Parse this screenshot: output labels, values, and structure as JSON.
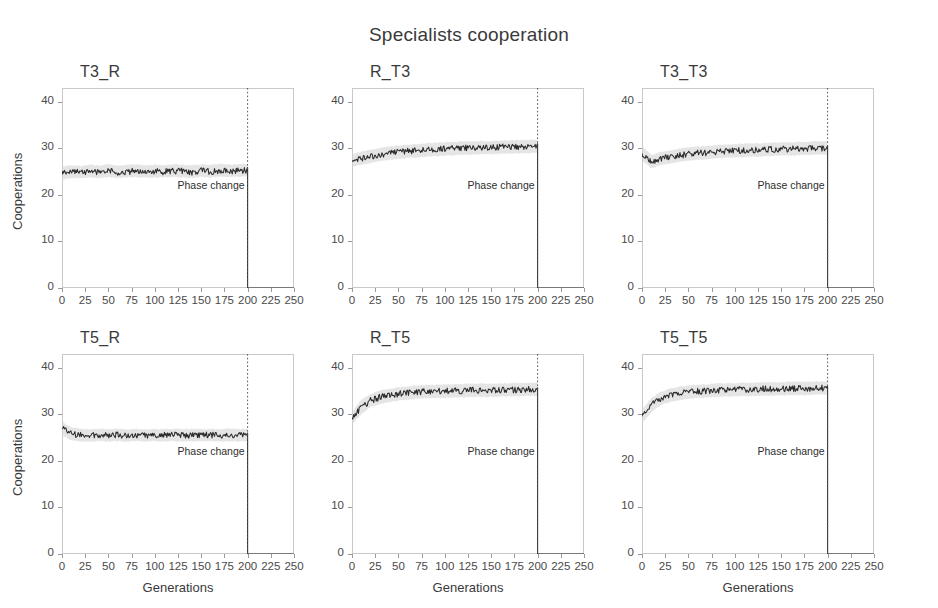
{
  "figure": {
    "title": "Specialists cooperation",
    "xlabel": "Generations",
    "ylabel": "Cooperations",
    "phase_label": "Phase change"
  },
  "chart_data": {
    "type": "line",
    "title": "Specialists cooperation",
    "xlabel": "Generations",
    "ylabel": "Cooperations",
    "xlim": [
      0,
      250
    ],
    "ylim": [
      0,
      43
    ],
    "xticks": [
      0,
      25,
      50,
      75,
      100,
      125,
      150,
      175,
      200,
      225,
      250
    ],
    "yticks": [
      0,
      10,
      20,
      30,
      40
    ],
    "grid": false,
    "legend": "none",
    "annotations": [
      {
        "text": "Phase change",
        "x": 200,
        "type": "vline-dotted",
        "note": "dotted vertical line at generation 200 in every panel"
      }
    ],
    "layout": {
      "rows": 2,
      "cols": 3
    },
    "band_note": "shaded gray band = variability envelope around mean trace",
    "panels": [
      {
        "title": "T3_R",
        "row": 0,
        "col": 0,
        "x": [
          0,
          10,
          20,
          30,
          40,
          50,
          60,
          70,
          80,
          90,
          100,
          110,
          120,
          130,
          140,
          150,
          160,
          170,
          180,
          190,
          200,
          200,
          210,
          220,
          230,
          240,
          250
        ],
        "mean": [
          24.6,
          25.0,
          24.8,
          25.1,
          24.9,
          25.2,
          24.9,
          25.0,
          25.2,
          24.9,
          25.1,
          25.0,
          25.2,
          25.1,
          24.9,
          25.2,
          25.0,
          25.3,
          25.1,
          25.2,
          25.3,
          0,
          0,
          0,
          0,
          0,
          0
        ],
        "band_low": [
          23.4,
          23.8,
          23.7,
          23.9,
          23.8,
          24.0,
          23.8,
          23.9,
          24.0,
          23.8,
          23.9,
          23.9,
          24.0,
          23.9,
          23.8,
          24.0,
          23.9,
          24.1,
          24.0,
          24.0,
          24.1,
          0,
          0,
          0,
          0,
          0,
          0
        ],
        "band_high": [
          25.9,
          26.3,
          26.1,
          26.4,
          26.2,
          26.5,
          26.2,
          26.3,
          26.5,
          26.2,
          26.4,
          26.3,
          26.5,
          26.4,
          26.2,
          26.5,
          26.3,
          26.6,
          26.4,
          26.5,
          26.6,
          0,
          0,
          0,
          0,
          0,
          0
        ]
      },
      {
        "title": "R_T3",
        "row": 0,
        "col": 1,
        "x": [
          0,
          10,
          20,
          30,
          40,
          50,
          60,
          70,
          80,
          90,
          100,
          110,
          120,
          130,
          140,
          150,
          160,
          170,
          180,
          190,
          200,
          200,
          210,
          220,
          230,
          240,
          250
        ],
        "mean": [
          27.4,
          27.9,
          28.3,
          28.7,
          29.0,
          29.2,
          29.4,
          29.5,
          29.7,
          29.8,
          29.9,
          30.0,
          30.1,
          30.1,
          30.2,
          30.2,
          30.3,
          30.3,
          30.4,
          30.4,
          30.5,
          0,
          0,
          0,
          0,
          0,
          0
        ],
        "band_low": [
          26.2,
          26.6,
          27.0,
          27.4,
          27.7,
          27.9,
          28.1,
          28.2,
          28.4,
          28.5,
          28.6,
          28.7,
          28.8,
          28.8,
          28.9,
          28.9,
          29.0,
          29.0,
          29.1,
          29.1,
          29.2,
          0,
          0,
          0,
          0,
          0,
          0
        ],
        "band_high": [
          28.6,
          29.2,
          29.6,
          30.0,
          30.3,
          30.5,
          30.7,
          30.8,
          31.0,
          31.1,
          31.2,
          31.3,
          31.4,
          31.4,
          31.5,
          31.5,
          31.6,
          31.6,
          31.7,
          31.7,
          31.8,
          0,
          0,
          0,
          0,
          0,
          0
        ]
      },
      {
        "title": "T3_T3",
        "row": 0,
        "col": 2,
        "x": [
          0,
          10,
          20,
          30,
          40,
          50,
          60,
          70,
          80,
          90,
          100,
          110,
          120,
          130,
          140,
          150,
          160,
          170,
          180,
          190,
          200,
          200,
          210,
          220,
          230,
          240,
          250
        ],
        "mean": [
          29.0,
          27.2,
          27.8,
          28.2,
          28.5,
          28.8,
          29.0,
          29.1,
          29.3,
          29.4,
          29.5,
          29.6,
          29.7,
          29.7,
          29.8,
          29.9,
          29.9,
          30.0,
          30.0,
          30.1,
          30.1,
          0,
          0,
          0,
          0,
          0,
          0
        ],
        "band_low": [
          27.6,
          25.9,
          26.5,
          26.9,
          27.2,
          27.5,
          27.7,
          27.8,
          28.0,
          28.1,
          28.2,
          28.3,
          28.4,
          28.4,
          28.5,
          28.6,
          28.6,
          28.7,
          28.7,
          28.8,
          28.8,
          0,
          0,
          0,
          0,
          0,
          0
        ],
        "band_high": [
          30.4,
          28.5,
          29.1,
          29.5,
          29.8,
          30.1,
          30.3,
          30.4,
          30.6,
          30.7,
          30.8,
          30.9,
          31.0,
          31.0,
          31.1,
          31.2,
          31.2,
          31.3,
          31.3,
          31.4,
          31.4,
          0,
          0,
          0,
          0,
          0,
          0
        ]
      },
      {
        "title": "T5_R",
        "row": 1,
        "col": 0,
        "x": [
          0,
          10,
          20,
          30,
          40,
          50,
          60,
          70,
          80,
          90,
          100,
          110,
          120,
          130,
          140,
          150,
          160,
          170,
          180,
          190,
          200,
          200,
          210,
          220,
          230,
          240,
          250
        ],
        "mean": [
          27.0,
          25.8,
          25.6,
          25.5,
          25.6,
          25.5,
          25.6,
          25.5,
          25.6,
          25.5,
          25.6,
          25.5,
          25.6,
          25.5,
          25.6,
          25.5,
          25.6,
          25.5,
          25.6,
          25.5,
          25.6,
          0,
          0,
          0,
          0,
          0,
          0
        ],
        "band_low": [
          25.7,
          24.5,
          24.4,
          24.3,
          24.4,
          24.3,
          24.4,
          24.3,
          24.4,
          24.3,
          24.4,
          24.3,
          24.4,
          24.3,
          24.4,
          24.3,
          24.4,
          24.3,
          24.4,
          24.3,
          24.4,
          0,
          0,
          0,
          0,
          0,
          0
        ],
        "band_high": [
          28.3,
          27.1,
          26.8,
          26.7,
          26.8,
          26.7,
          26.8,
          26.7,
          26.8,
          26.7,
          26.8,
          26.7,
          26.8,
          26.7,
          26.8,
          26.7,
          26.8,
          26.7,
          26.8,
          26.7,
          26.8,
          0,
          0,
          0,
          0,
          0,
          0
        ]
      },
      {
        "title": "R_T5",
        "row": 1,
        "col": 1,
        "x": [
          0,
          10,
          20,
          30,
          40,
          50,
          60,
          70,
          80,
          90,
          100,
          110,
          120,
          130,
          140,
          150,
          160,
          170,
          180,
          190,
          200,
          200,
          210,
          220,
          230,
          240,
          250
        ],
        "mean": [
          29.2,
          31.6,
          33.0,
          33.7,
          34.1,
          34.4,
          34.6,
          34.8,
          34.9,
          35.0,
          35.0,
          35.1,
          35.1,
          35.2,
          35.2,
          35.2,
          35.3,
          35.3,
          35.3,
          35.4,
          35.4,
          0,
          0,
          0,
          0,
          0,
          0
        ],
        "band_low": [
          27.9,
          30.2,
          31.7,
          32.4,
          32.8,
          33.1,
          33.3,
          33.5,
          33.6,
          33.7,
          33.7,
          33.8,
          33.8,
          33.9,
          33.9,
          33.9,
          34.0,
          34.0,
          34.0,
          34.1,
          34.1,
          0,
          0,
          0,
          0,
          0,
          0
        ],
        "band_high": [
          30.5,
          33.0,
          34.3,
          35.0,
          35.4,
          35.7,
          35.9,
          36.1,
          36.2,
          36.3,
          36.3,
          36.4,
          36.4,
          36.5,
          36.5,
          36.5,
          36.6,
          36.6,
          36.6,
          36.7,
          36.7,
          0,
          0,
          0,
          0,
          0,
          0
        ]
      },
      {
        "title": "T5_T5",
        "row": 1,
        "col": 2,
        "x": [
          0,
          10,
          20,
          30,
          40,
          50,
          60,
          70,
          80,
          90,
          100,
          110,
          120,
          130,
          140,
          150,
          160,
          170,
          180,
          190,
          200,
          200,
          210,
          220,
          230,
          240,
          250
        ],
        "mean": [
          29.6,
          32.0,
          33.4,
          34.1,
          34.5,
          34.8,
          35.0,
          35.1,
          35.2,
          35.3,
          35.3,
          35.4,
          35.4,
          35.5,
          35.5,
          35.5,
          35.6,
          35.6,
          35.6,
          35.7,
          35.7,
          0,
          0,
          0,
          0,
          0,
          0
        ],
        "band_low": [
          28.3,
          30.6,
          32.1,
          32.8,
          33.2,
          33.5,
          33.7,
          33.8,
          33.9,
          34.0,
          34.0,
          34.1,
          34.1,
          34.2,
          34.2,
          34.2,
          34.3,
          34.3,
          34.3,
          34.4,
          34.4,
          0,
          0,
          0,
          0,
          0,
          0
        ],
        "band_high": [
          30.9,
          33.4,
          34.7,
          35.4,
          35.8,
          36.1,
          36.3,
          36.4,
          36.5,
          36.6,
          36.6,
          36.7,
          36.7,
          36.8,
          36.8,
          36.8,
          36.9,
          36.9,
          36.9,
          37.0,
          37.0,
          0,
          0,
          0,
          0,
          0,
          0
        ]
      }
    ]
  }
}
